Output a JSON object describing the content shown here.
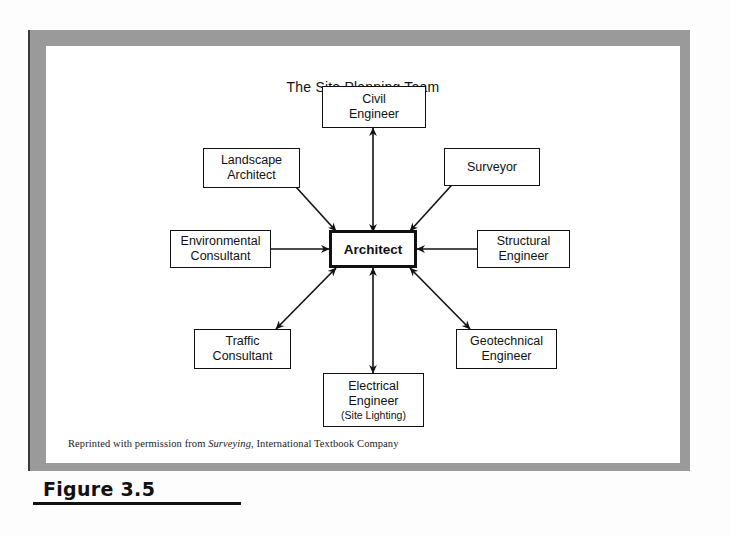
{
  "figure": {
    "label": "Figure 3.5",
    "credit_prefix": "Reprinted with permission from ",
    "credit_italic": "Surveying",
    "credit_suffix": ", International Textbook Company"
  },
  "diagram": {
    "title": "The Site Planning Team",
    "center": {
      "id": "architect",
      "label": "Architect"
    },
    "nodes": [
      {
        "id": "civil-engineer",
        "line1": "Civil",
        "line2": "Engineer",
        "line3": ""
      },
      {
        "id": "landscape-architect",
        "line1": "Landscape",
        "line2": "Architect",
        "line3": ""
      },
      {
        "id": "surveyor",
        "line1": "Surveyor",
        "line2": "",
        "line3": ""
      },
      {
        "id": "environmental-consultant",
        "line1": "Environmental",
        "line2": "Consultant",
        "line3": ""
      },
      {
        "id": "structural-engineer",
        "line1": "Structural",
        "line2": "Engineer",
        "line3": ""
      },
      {
        "id": "traffic-consultant",
        "line1": "Traffic",
        "line2": "Consultant",
        "line3": ""
      },
      {
        "id": "geotechnical-engineer",
        "line1": "Geotechnical",
        "line2": "Engineer",
        "line3": ""
      },
      {
        "id": "electrical-engineer",
        "line1": "Electrical",
        "line2": "Engineer",
        "line3": "(Site Lighting)"
      }
    ],
    "connections": [
      {
        "from": "architect",
        "to": "civil-engineer",
        "style": "double-arrow"
      },
      {
        "from": "architect",
        "to": "landscape-architect",
        "style": "double-arrow"
      },
      {
        "from": "architect",
        "to": "surveyor",
        "style": "double-arrow"
      },
      {
        "from": "architect",
        "to": "environmental-consultant",
        "style": "double-arrow"
      },
      {
        "from": "architect",
        "to": "structural-engineer",
        "style": "double-arrow"
      },
      {
        "from": "architect",
        "to": "traffic-consultant",
        "style": "double-arrow"
      },
      {
        "from": "architect",
        "to": "geotechnical-engineer",
        "style": "double-arrow"
      },
      {
        "from": "architect",
        "to": "electrical-engineer",
        "style": "double-arrow"
      }
    ]
  },
  "colors": {
    "frame": "#9a9a9a",
    "ink": "#111111",
    "paper": "#ffffff"
  }
}
